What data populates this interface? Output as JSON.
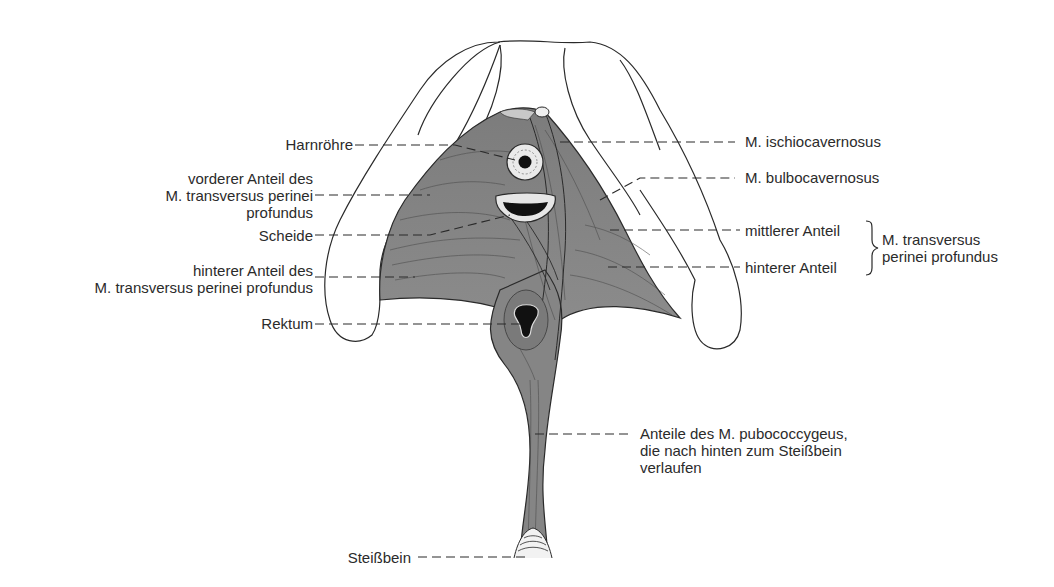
{
  "figure": {
    "left_labels": {
      "harnroehre": "Harnröhre",
      "vorderer_anteil": "vorderer Anteil des\nM. transversus perinei\nprofundus",
      "scheide": "Scheide",
      "hinterer_anteil_left": "hinterer Anteil des\nM. transversus perinei profundus",
      "rektum": "Rektum",
      "steissbein": "Steißbein"
    },
    "right_labels": {
      "ischiocavernosus": "M. ischiocavernosus",
      "bulbocavernosus": "M. bulbocavernosus",
      "mittlerer_anteil": "mittlerer Anteil",
      "hinterer_anteil_right": "hinterer Anteil",
      "transversus_group": "M. transversus\nperinei profundus",
      "pubococcygeus": "Anteile des M. pubococcygeus,\ndie nach hinten zum Steißbein\nverlaufen"
    },
    "colors": {
      "muscle": "#8a8a8a",
      "muscle_dark": "#5e5e5e",
      "outline": "#2a2a2a",
      "background": "#ffffff"
    }
  }
}
